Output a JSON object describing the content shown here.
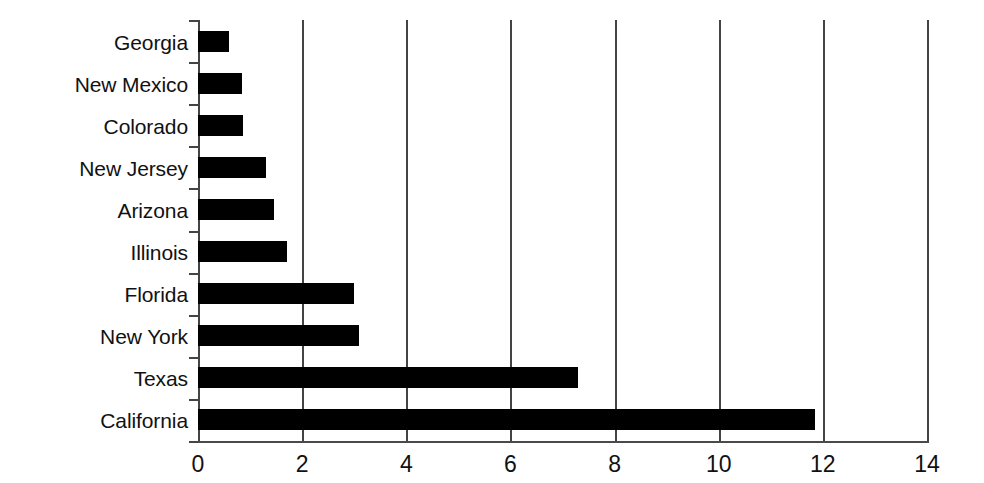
{
  "chart_data": {
    "type": "bar",
    "orientation": "horizontal",
    "title": "",
    "subtitle": "",
    "xlabel": "",
    "ylabel": "",
    "categories": [
      "Georgia",
      "New Mexico",
      "Colorado",
      "New Jersey",
      "Arizona",
      "Illinois",
      "Florida",
      "New York",
      "Texas",
      "California"
    ],
    "values": [
      0.6,
      0.85,
      0.87,
      1.3,
      1.45,
      1.7,
      3.0,
      3.1,
      7.3,
      11.85
    ],
    "xlim": [
      0,
      14
    ],
    "xticks": [
      0,
      2,
      4,
      6,
      8,
      10,
      12,
      14
    ],
    "xtick_labels": [
      "0",
      "2",
      "4",
      "6",
      "8",
      "10",
      "12",
      "14"
    ],
    "grid": "vertical",
    "legend": "none",
    "bar_color": "#000000",
    "axis_color": "#444444",
    "background_color": "#ffffff"
  },
  "colors": {
    "bar": "#000000",
    "axis": "#444444",
    "grid": "#444444",
    "text": "#111111",
    "background": "#ffffff"
  }
}
